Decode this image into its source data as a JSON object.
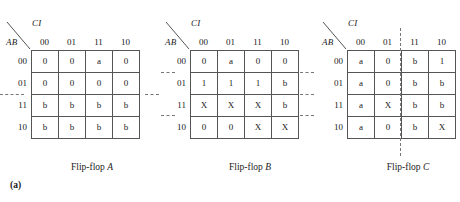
{
  "figure": {
    "part_label": "(a)",
    "maps": [
      {
        "id": "flip-flop-a",
        "top_var": "CI",
        "side_var": "AB",
        "col_labels": [
          "00",
          "01",
          "11",
          "10"
        ],
        "row_labels": [
          "00",
          "01",
          "11",
          "10"
        ],
        "cells": [
          [
            "0",
            "0",
            "a",
            "0"
          ],
          [
            "0",
            "0",
            "0",
            "0"
          ],
          [
            "b",
            "b",
            "b",
            "b"
          ],
          [
            "b",
            "b",
            "b",
            "b"
          ]
        ],
        "caption": "Flip-flop ",
        "caption_var": "A",
        "groups": [
          {
            "type": "horizontal",
            "after_row": 1,
            "span": "full-wide"
          }
        ]
      },
      {
        "id": "flip-flop-b",
        "top_var": "CI",
        "side_var": "AB",
        "col_labels": [
          "00",
          "01",
          "11",
          "10"
        ],
        "row_labels": [
          "00",
          "01",
          "11",
          "10"
        ],
        "cells": [
          [
            "0",
            "a",
            "0",
            "0"
          ],
          [
            "1",
            "1",
            "1",
            "b"
          ],
          [
            "X",
            "X",
            "X",
            "b"
          ],
          [
            "0",
            "0",
            "X",
            "X"
          ]
        ],
        "caption": "Flip-flop ",
        "caption_var": "B",
        "groups": [
          {
            "type": "horizontal",
            "after_row": 0,
            "span": "left-tick"
          },
          {
            "type": "horizontal",
            "after_row": 2,
            "span": "left-tick"
          }
        ]
      },
      {
        "id": "flip-flop-c",
        "top_var": "CI",
        "side_var": "AB",
        "col_labels": [
          "00",
          "01",
          "11",
          "10"
        ],
        "row_labels": [
          "00",
          "01",
          "11",
          "10"
        ],
        "cells": [
          [
            "a",
            "0",
            "b",
            "1"
          ],
          [
            "a",
            "0",
            "b",
            "b"
          ],
          [
            "a",
            "X",
            "b",
            "b"
          ],
          [
            "a",
            "0",
            "b",
            "X"
          ]
        ],
        "caption": "Flip-flop ",
        "caption_var": "C",
        "groups": [
          {
            "type": "horizontal",
            "after_row": 0,
            "span": "left-tick"
          },
          {
            "type": "horizontal",
            "after_row": 1,
            "span": "left-tick"
          },
          {
            "type": "horizontal",
            "after_row": 2,
            "span": "left-tick"
          },
          {
            "type": "vertical",
            "after_col": 1,
            "span": "full-tall"
          }
        ]
      }
    ]
  },
  "colors": {
    "ink": "#1a1a1a",
    "rule": "#555555",
    "dash": "#777777",
    "page": "#ffffff"
  }
}
